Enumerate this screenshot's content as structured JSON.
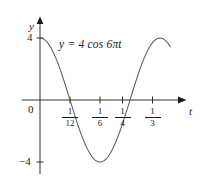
{
  "figure": {
    "background_color": "#ffffff",
    "ink_color": "#1a1a1a",
    "curve_color": "#5a5a5a"
  },
  "labels": {
    "y_axis": "y",
    "t_axis": "t",
    "origin": "0",
    "y_tick_positive": "4",
    "y_tick_negative": "−4",
    "equation_y": "y",
    "equation_equals": "=",
    "equation_rhs": "4 cos 6πt",
    "equation_full": "y = 4 cos 6πt"
  },
  "x_ticks": [
    {
      "label": "1/12",
      "numerator": "1",
      "denominator": "12",
      "value": 0.08333
    },
    {
      "label": "1/6",
      "numerator": "1",
      "denominator": "6",
      "value": 0.16667
    },
    {
      "label": "1/4",
      "numerator": "1",
      "denominator": "4",
      "value": 0.25
    },
    {
      "label": "1/3",
      "numerator": "1",
      "denominator": "3",
      "value": 0.33333
    }
  ],
  "chart_data": {
    "type": "line",
    "title": "",
    "subtitle": "",
    "xlabel": "t",
    "ylabel": "y",
    "annotations": [
      "y = 4 cos 6πt"
    ],
    "grid": false,
    "legend": null,
    "function": "y = 4 cos(6πt)",
    "amplitude": 4,
    "period": 0.33333,
    "frequency_hz": 3,
    "xlim": [
      -0.022,
      0.395
    ],
    "ylim": [
      -5.6,
      5.6
    ],
    "xtick_labels": [
      "1/12",
      "1/6",
      "1/4",
      "1/3"
    ],
    "xtick_values": [
      0.08333,
      0.16667,
      0.25,
      0.33333
    ],
    "ytick_labels": [
      "4",
      "−4"
    ],
    "ytick_values": [
      4,
      -4
    ],
    "x_domain_drawn": [
      0,
      0.362
    ],
    "key_points": [
      {
        "t": 0,
        "y": 4,
        "kind": "maximum"
      },
      {
        "t": 0.08333,
        "y": 0,
        "kind": "zero-crossing"
      },
      {
        "t": 0.16667,
        "y": -4,
        "kind": "minimum"
      },
      {
        "t": 0.25,
        "y": 0,
        "kind": "zero-crossing"
      },
      {
        "t": 0.33333,
        "y": 4,
        "kind": "maximum"
      },
      {
        "t": 0.362,
        "y": 2.6,
        "kind": "endpoint"
      }
    ],
    "series": [
      {
        "name": "y = 4 cos 6πt",
        "x": [
          0,
          0.0167,
          0.0333,
          0.05,
          0.0667,
          0.0833,
          0.1,
          0.1167,
          0.1333,
          0.15,
          0.1667,
          0.1833,
          0.2,
          0.2167,
          0.2333,
          0.25,
          0.2667,
          0.2833,
          0.3,
          0.3167,
          0.3333,
          0.3467,
          0.362
        ],
        "y": [
          4,
          3.24,
          1.24,
          -1.24,
          -3.24,
          0,
          -3.24,
          -1.24,
          1.24,
          3.24,
          -4,
          -3.24,
          -1.24,
          1.24,
          3.24,
          0,
          3.24,
          1.24,
          -1.24,
          -3.24,
          4,
          3.68,
          2.6
        ]
      }
    ]
  }
}
